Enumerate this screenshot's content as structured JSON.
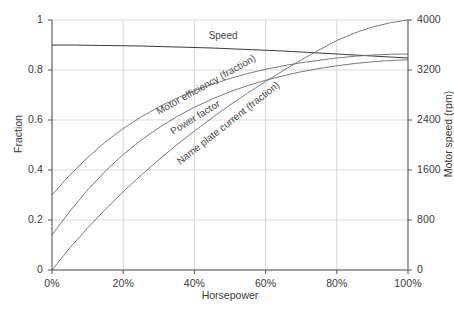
{
  "chart_data": {
    "type": "line",
    "title": "",
    "xlabel": "Horsepower",
    "ylabel": "Fraction",
    "y2label": "Motor speed (rpm)",
    "xlim": [
      0,
      100
    ],
    "ylim": [
      0,
      1
    ],
    "y2lim": [
      0,
      4000
    ],
    "grid": true,
    "legend_position": "inline-labels",
    "x_tick_labels": [
      "0%",
      "20%",
      "40%",
      "60%",
      "80%",
      "100%"
    ],
    "x_tick_values": [
      0,
      20,
      40,
      60,
      80,
      100
    ],
    "y_tick_labels": [
      "0",
      "0.2",
      "0.4",
      "0.6",
      "0.8",
      "1"
    ],
    "y_tick_values": [
      0,
      0.2,
      0.4,
      0.6,
      0.8,
      1
    ],
    "y2_tick_labels": [
      "0",
      "800",
      "1600",
      "2400",
      "3200",
      "4000"
    ],
    "y2_tick_values": [
      0,
      800,
      1600,
      2400,
      3200,
      4000
    ],
    "x": [
      0,
      5,
      10,
      15,
      20,
      25,
      30,
      35,
      40,
      45,
      50,
      55,
      60,
      65,
      70,
      75,
      80,
      85,
      90,
      95,
      100
    ],
    "series": [
      {
        "name": "Speed",
        "label": "Speed",
        "axis": "left",
        "color": "#3c3c3c",
        "values": [
          0.9,
          0.9,
          0.899,
          0.898,
          0.897,
          0.896,
          0.894,
          0.892,
          0.89,
          0.888,
          0.885,
          0.882,
          0.879,
          0.876,
          0.872,
          0.868,
          0.864,
          0.86,
          0.856,
          0.852,
          0.848
        ],
        "label_x": 44,
        "label_y": 0.925
      },
      {
        "name": "Motor efficiency (fraction)",
        "label": "Motor efficiency (fraction)",
        "axis": "left",
        "color": "#6b6b6b",
        "values": [
          0.3,
          0.38,
          0.45,
          0.512,
          0.566,
          0.612,
          0.652,
          0.687,
          0.717,
          0.743,
          0.766,
          0.786,
          0.803,
          0.817,
          0.829,
          0.839,
          0.848,
          0.855,
          0.86,
          0.863,
          0.864
        ],
        "label_x": 30,
        "label_y": 0.62
      },
      {
        "name": "Power factor",
        "label": "Power factor",
        "axis": "left",
        "color": "#6b6b6b",
        "values": [
          0.14,
          0.235,
          0.32,
          0.396,
          0.462,
          0.519,
          0.569,
          0.613,
          0.651,
          0.684,
          0.713,
          0.738,
          0.759,
          0.777,
          0.793,
          0.806,
          0.817,
          0.826,
          0.833,
          0.838,
          0.841
        ],
        "label_x": 34,
        "label_y": 0.54
      },
      {
        "name": "Name plate current (fraction)",
        "label": "Name plate current (fraction)",
        "axis": "left",
        "color": "#6b6b6b",
        "values": [
          0.0,
          0.088,
          0.168,
          0.243,
          0.313,
          0.379,
          0.441,
          0.5,
          0.556,
          0.609,
          0.66,
          0.708,
          0.754,
          0.798,
          0.84,
          0.88,
          0.918,
          0.948,
          0.972,
          0.989,
          1.0
        ],
        "label_x": 36,
        "label_y": 0.42
      }
    ]
  }
}
